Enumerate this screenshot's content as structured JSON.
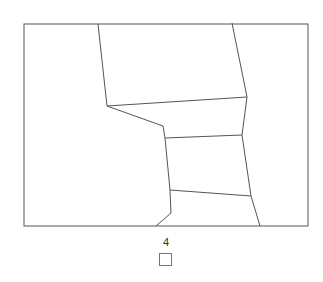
{
  "map": {
    "frame": {
      "x1": 24,
      "y1": 24,
      "x2": 308,
      "y2": 226
    },
    "stroke_color": "#555555",
    "fill_color": "#ffffff",
    "region_boundaries": [
      [
        [
          98,
          24
        ],
        [
          107,
          106
        ],
        [
          163,
          126
        ],
        [
          165,
          138
        ],
        [
          170,
          190
        ],
        [
          171,
          213
        ],
        [
          156,
          226
        ]
      ],
      [
        [
          232,
          23
        ],
        [
          247,
          97
        ],
        [
          242,
          135
        ],
        [
          251,
          196
        ],
        [
          260,
          226
        ]
      ],
      [
        [
          107,
          106
        ],
        [
          247,
          97
        ]
      ],
      [
        [
          165,
          138
        ],
        [
          242,
          135
        ]
      ],
      [
        [
          170,
          190
        ],
        [
          251,
          196
        ]
      ]
    ]
  },
  "legend": {
    "label": "4",
    "swatch_color": "#ffffff"
  }
}
